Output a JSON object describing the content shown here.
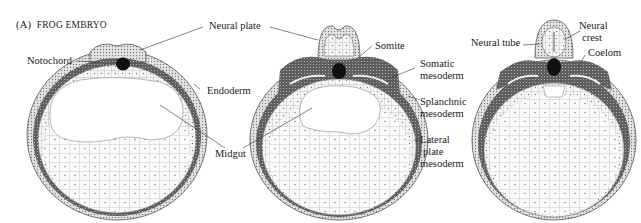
{
  "figure": {
    "panel_label": "(A)",
    "panel_title": "FROG EMBRYO"
  },
  "labels": {
    "notochord": "Notochord",
    "neural_plate": "Neural plate",
    "endoderm": "Endoderm",
    "midgut": "Midgut",
    "somite": "Somite",
    "somatic_1": "Somatic",
    "somatic_2": "mesoderm",
    "splanchnic_1": "Splanchnic",
    "splanchnic_2": "mesoderm",
    "lateral_1": "Lateral",
    "lateral_2": "plate",
    "lateral_3": "mesoderm",
    "neural_tube": "Neural tube",
    "neural_crest_1": "Neural",
    "neural_crest_2": "crest",
    "coelom": "Coelom"
  },
  "stages": [
    {
      "id": "stage-1",
      "description": "neural plate stage"
    },
    {
      "id": "stage-2",
      "description": "neural fold stage"
    },
    {
      "id": "stage-3",
      "description": "neural tube stage"
    }
  ],
  "colors": {
    "ink": "#1a1a1a",
    "mesoderm": "#6e6e6e",
    "ectoderm": "#d9d9d9",
    "yolk": "#f2f2f2",
    "notochord": "#111111"
  }
}
